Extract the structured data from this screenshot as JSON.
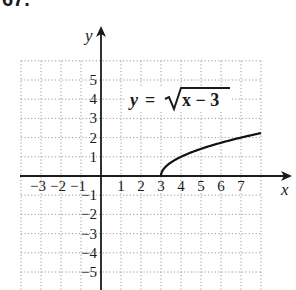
{
  "problem_number": "67.",
  "chart_data": {
    "type": "line",
    "title": "",
    "equation_label": "y = √(x − 3)",
    "equation_parts": {
      "lhs": "y",
      "eq": "=",
      "radicand": "x − 3"
    },
    "xlabel": "x",
    "ylabel": "y",
    "xlim": [
      -4,
      8
    ],
    "ylim": [
      -6,
      6
    ],
    "grid": true,
    "grid_style": "dotted",
    "x_ticks": [
      "-3",
      "-2",
      "-1",
      "1",
      "2",
      "3",
      "4",
      "5",
      "6",
      "7"
    ],
    "y_ticks": [
      "5",
      "4",
      "3",
      "2",
      "1",
      "-1",
      "-2",
      "-3",
      "-4",
      "-5"
    ],
    "series": [
      {
        "name": "y = sqrt(x - 3)",
        "x": [
          3,
          3.05,
          3.2,
          3.5,
          4,
          4.5,
          5,
          5.5,
          6,
          6.5,
          7,
          7.5,
          8
        ],
        "y": [
          0,
          0.224,
          0.447,
          0.707,
          1,
          1.225,
          1.414,
          1.581,
          1.732,
          1.871,
          2,
          2.121,
          2.236
        ]
      }
    ],
    "colors": {
      "axis": "#1a1a1a",
      "grid": "#9a9a9a",
      "curve": "#111111"
    }
  }
}
